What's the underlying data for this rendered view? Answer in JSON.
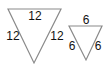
{
  "diagram": {
    "type": "similar-triangles",
    "colors": {
      "stroke": "#8a8a8a",
      "text": "#111111",
      "background": "#ffffff"
    },
    "triangles": [
      {
        "id": "large",
        "orientation": "pointing-down",
        "labels": {
          "top": "12",
          "left": "12",
          "right": "12"
        }
      },
      {
        "id": "small",
        "orientation": "pointing-down",
        "labels": {
          "top": "6",
          "left": "6",
          "right": "6"
        }
      }
    ]
  }
}
